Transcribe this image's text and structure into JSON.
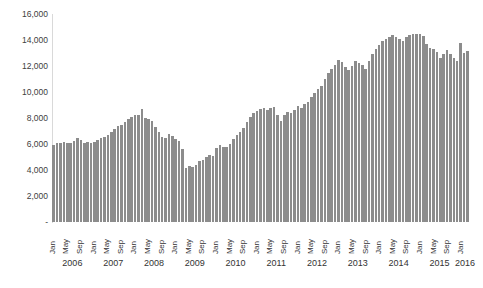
{
  "chart_data": {
    "type": "bar",
    "title": "",
    "subtitle": "",
    "xlabel": "",
    "ylabel": "",
    "ylim": [
      0,
      16000
    ],
    "ytick_labels": [
      "16,000",
      "14,000",
      "12,000",
      "10,000",
      "8,000",
      "6,000",
      "4,000",
      "2,000",
      "-"
    ],
    "ytick_values": [
      16000,
      14000,
      12000,
      10000,
      8000,
      6000,
      4000,
      2000,
      0
    ],
    "grid": false,
    "legend": "none",
    "bar_color": "#8c8c8c",
    "axis_color": "#d9d9d9",
    "text_color": "#333333",
    "month_tick_labels": [
      "Jan",
      "May",
      "Sep"
    ],
    "year_labels": [
      "2006",
      "2007",
      "2008",
      "2009",
      "2010",
      "2011",
      "2012",
      "2013",
      "2014",
      "2015",
      "2016"
    ],
    "categories": [
      "2006-Jan",
      "2006-Feb",
      "2006-Mar",
      "2006-Apr",
      "2006-May",
      "2006-Jun",
      "2006-Jul",
      "2006-Aug",
      "2006-Sep",
      "2006-Oct",
      "2006-Nov",
      "2006-Dec",
      "2007-Jan",
      "2007-Feb",
      "2007-Mar",
      "2007-Apr",
      "2007-May",
      "2007-Jun",
      "2007-Jul",
      "2007-Aug",
      "2007-Sep",
      "2007-Oct",
      "2007-Nov",
      "2007-Dec",
      "2008-Jan",
      "2008-Feb",
      "2008-Mar",
      "2008-Apr",
      "2008-May",
      "2008-Jun",
      "2008-Jul",
      "2008-Aug",
      "2008-Sep",
      "2008-Oct",
      "2008-Nov",
      "2008-Dec",
      "2009-Jan",
      "2009-Feb",
      "2009-Mar",
      "2009-Apr",
      "2009-May",
      "2009-Jun",
      "2009-Jul",
      "2009-Aug",
      "2009-Sep",
      "2009-Oct",
      "2009-Nov",
      "2009-Dec",
      "2010-Jan",
      "2010-Feb",
      "2010-Mar",
      "2010-Apr",
      "2010-May",
      "2010-Jun",
      "2010-Jul",
      "2010-Aug",
      "2010-Sep",
      "2010-Oct",
      "2010-Nov",
      "2010-Dec",
      "2011-Jan",
      "2011-Feb",
      "2011-Mar",
      "2011-Apr",
      "2011-May",
      "2011-Jun",
      "2011-Jul",
      "2011-Aug",
      "2011-Sep",
      "2011-Oct",
      "2011-Nov",
      "2011-Dec",
      "2012-Jan",
      "2012-Feb",
      "2012-Mar",
      "2012-Apr",
      "2012-May",
      "2012-Jun",
      "2012-Jul",
      "2012-Aug",
      "2012-Sep",
      "2012-Oct",
      "2012-Nov",
      "2012-Dec",
      "2013-Jan",
      "2013-Feb",
      "2013-Mar",
      "2013-Apr",
      "2013-May",
      "2013-Jun",
      "2013-Jul",
      "2013-Aug",
      "2013-Sep",
      "2013-Oct",
      "2013-Nov",
      "2013-Dec",
      "2014-Jan",
      "2014-Feb",
      "2014-Mar",
      "2014-Apr",
      "2014-May",
      "2014-Jun",
      "2014-Jul",
      "2014-Aug",
      "2014-Sep",
      "2014-Oct",
      "2014-Nov",
      "2014-Dec",
      "2015-Jan",
      "2015-Feb",
      "2015-Mar",
      "2015-Apr",
      "2015-May",
      "2015-Jun",
      "2015-Jul",
      "2015-Aug",
      "2015-Sep",
      "2015-Oct",
      "2015-Nov",
      "2015-Dec",
      "2016-Jan",
      "2016-Feb",
      "2016-Mar"
    ],
    "values": [
      5950,
      6050,
      6100,
      6150,
      6100,
      6050,
      6200,
      6450,
      6300,
      6100,
      6150,
      6100,
      6150,
      6300,
      6450,
      6550,
      6700,
      6900,
      7150,
      7350,
      7500,
      7700,
      7900,
      8100,
      8250,
      8200,
      8700,
      8000,
      7950,
      7800,
      7300,
      6900,
      6550,
      6500,
      6750,
      6600,
      6350,
      6250,
      5650,
      4150,
      4300,
      4250,
      4400,
      4700,
      4800,
      5000,
      5150,
      5050,
      5700,
      5900,
      5800,
      5750,
      6000,
      6350,
      6700,
      6950,
      7250,
      7700,
      8100,
      8350,
      8550,
      8700,
      8800,
      8650,
      8750,
      8850,
      8200,
      7800,
      8200,
      8450,
      8400,
      8600,
      8900,
      8800,
      9050,
      9250,
      9600,
      9900,
      10250,
      10500,
      11000,
      11500,
      11800,
      12100,
      12450,
      12300,
      11900,
      11700,
      12000,
      12400,
      12250,
      12100,
      11800,
      12400,
      12900,
      13300,
      13600,
      13900,
      14050,
      14250,
      14400,
      14200,
      14050,
      13900,
      14200,
      14350,
      14500,
      14450,
      14500,
      14300,
      13700,
      13350,
      13300,
      13100,
      12600,
      12900,
      13200,
      12900,
      12600,
      12400,
      13800,
      13000,
      13150
    ]
  }
}
